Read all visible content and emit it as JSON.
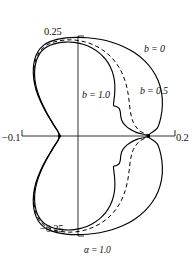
{
  "figure": {
    "title": "",
    "parameter_label": "α = 1.0",
    "axes": {
      "x_left_label": "−0.1",
      "x_right_label": "0.2",
      "y_top_label": "0.25",
      "y_bottom_label": "−0.25"
    },
    "curve_labels": {
      "b0": "b = 0",
      "b05": "b = 0.5",
      "b10": "b = 1.0"
    }
  },
  "chart_data": {
    "type": "line",
    "title": "",
    "subtitle": "",
    "xlabel": "",
    "ylabel": "",
    "xlim": [
      -0.1,
      0.2
    ],
    "ylim": [
      -0.25,
      0.25
    ],
    "grid": false,
    "legend_position": "inline-annotations",
    "xticks": [
      -0.1,
      0.2
    ],
    "xticklabels": [
      "−0.1",
      "0.2"
    ],
    "yticks": [
      -0.25,
      0.25
    ],
    "yticklabels": [
      "−0.25",
      "0.25"
    ],
    "annotations": [
      {
        "text": "b = 0",
        "x": 0.145,
        "y": 0.205
      },
      {
        "text": "b = 0.5",
        "x": 0.135,
        "y": 0.112
      },
      {
        "text": "b = 1.0",
        "x": 0.022,
        "y": 0.105
      },
      {
        "text": "α = 1.0",
        "x": 0.012,
        "y": -0.285
      }
    ],
    "node_points": [
      {
        "x": -0.0265,
        "y": 0.0
      },
      {
        "x": 0.1475,
        "y": 0.0
      }
    ],
    "series": [
      {
        "name": "b = 0",
        "label": "b = 0",
        "style": "solid",
        "color": "#000000",
        "points": [
          [
            -0.0265,
            0.0
          ],
          [
            -0.0391,
            0.0295
          ],
          [
            -0.0531,
            0.0596
          ],
          [
            -0.0645,
            0.0884
          ],
          [
            -0.0726,
            0.1163
          ],
          [
            -0.0771,
            0.1433
          ],
          [
            -0.0778,
            0.1693
          ],
          [
            -0.0748,
            0.1929
          ],
          [
            -0.0683,
            0.2118
          ],
          [
            -0.0586,
            0.2258
          ],
          [
            -0.0462,
            0.2353
          ],
          [
            -0.0314,
            0.2415
          ],
          [
            -0.0139,
            0.2452
          ],
          [
            0.0062,
            0.2466
          ],
          [
            0.0286,
            0.2456
          ],
          [
            0.0523,
            0.2418
          ],
          [
            0.0762,
            0.2345
          ],
          [
            0.0993,
            0.2233
          ],
          [
            0.1209,
            0.2079
          ],
          [
            0.14,
            0.1884
          ],
          [
            0.1556,
            0.1651
          ],
          [
            0.1669,
            0.1386
          ],
          [
            0.1735,
            0.1097
          ],
          [
            0.1753,
            0.079
          ],
          [
            0.1724,
            0.0477
          ],
          [
            0.1649,
            0.019
          ],
          [
            0.1475,
            0.0
          ],
          [
            0.1649,
            -0.019
          ],
          [
            0.1724,
            -0.0477
          ],
          [
            0.1753,
            -0.079
          ],
          [
            0.1735,
            -0.1097
          ],
          [
            0.1669,
            -0.1386
          ],
          [
            0.1556,
            -0.1651
          ],
          [
            0.14,
            -0.1884
          ],
          [
            0.1209,
            -0.2079
          ],
          [
            0.0993,
            -0.2233
          ],
          [
            0.0762,
            -0.2345
          ],
          [
            0.0523,
            -0.2418
          ],
          [
            0.0286,
            -0.2456
          ],
          [
            0.0062,
            -0.2466
          ],
          [
            -0.0139,
            -0.2452
          ],
          [
            -0.0314,
            -0.2415
          ],
          [
            -0.0462,
            -0.2353
          ],
          [
            -0.0586,
            -0.2258
          ],
          [
            -0.0683,
            -0.2118
          ],
          [
            -0.0748,
            -0.1929
          ],
          [
            -0.0778,
            -0.1693
          ],
          [
            -0.0771,
            -0.1433
          ],
          [
            -0.0726,
            -0.1163
          ],
          [
            -0.0645,
            -0.0884
          ],
          [
            -0.0531,
            -0.0596
          ],
          [
            -0.0391,
            -0.0295
          ],
          [
            -0.0265,
            0.0
          ]
        ]
      },
      {
        "name": "b = 0.5",
        "label": "b = 0.5",
        "style": "dashed",
        "color": "#000000",
        "points": [
          [
            -0.0265,
            0.0
          ],
          [
            -0.0385,
            0.029
          ],
          [
            -0.0521,
            0.0586
          ],
          [
            -0.0632,
            0.0869
          ],
          [
            -0.0712,
            0.1143
          ],
          [
            -0.0757,
            0.1409
          ],
          [
            -0.0764,
            0.1664
          ],
          [
            -0.0734,
            0.1896
          ],
          [
            -0.067,
            0.2082
          ],
          [
            -0.0576,
            0.2219
          ],
          [
            -0.0455,
            0.2311
          ],
          [
            -0.0312,
            0.237
          ],
          [
            -0.0148,
            0.24
          ],
          [
            0.0032,
            0.2399
          ],
          [
            0.0219,
            0.2358
          ],
          [
            0.0403,
            0.2277
          ],
          [
            0.0575,
            0.2157
          ],
          [
            0.0726,
            0.2001
          ],
          [
            0.0853,
            0.1812
          ],
          [
            0.0952,
            0.1598
          ],
          [
            0.1024,
            0.1364
          ],
          [
            0.1072,
            0.1116
          ],
          [
            0.1102,
            0.0858
          ],
          [
            0.1127,
            0.0593
          ],
          [
            0.1183,
            0.034
          ],
          [
            0.13,
            0.0135
          ],
          [
            0.1475,
            0.0
          ],
          [
            0.13,
            -0.0135
          ],
          [
            0.1183,
            -0.034
          ],
          [
            0.1127,
            -0.0593
          ],
          [
            0.1102,
            -0.0858
          ],
          [
            0.1072,
            -0.1116
          ],
          [
            0.1024,
            -0.1364
          ],
          [
            0.0952,
            -0.1598
          ],
          [
            0.0853,
            -0.1812
          ],
          [
            0.0726,
            -0.2001
          ],
          [
            0.0575,
            -0.2157
          ],
          [
            0.0403,
            -0.2277
          ],
          [
            0.0219,
            -0.2358
          ],
          [
            0.0032,
            -0.2399
          ],
          [
            -0.0148,
            -0.24
          ],
          [
            -0.0312,
            -0.237
          ],
          [
            -0.0455,
            -0.2311
          ],
          [
            -0.0576,
            -0.2219
          ],
          [
            -0.067,
            -0.2082
          ],
          [
            -0.0734,
            -0.1896
          ],
          [
            -0.0764,
            -0.1664
          ],
          [
            -0.0757,
            -0.1409
          ],
          [
            -0.0712,
            -0.1143
          ],
          [
            -0.0632,
            -0.0869
          ],
          [
            -0.0521,
            -0.0586
          ],
          [
            -0.0385,
            -0.029
          ],
          [
            -0.0265,
            0.0
          ]
        ]
      },
      {
        "name": "b = 1.0",
        "label": "b = 1.0",
        "style": "solid",
        "color": "#000000",
        "points": [
          [
            -0.0265,
            0.0
          ],
          [
            -0.038,
            0.0285
          ],
          [
            -0.0512,
            0.0576
          ],
          [
            -0.0621,
            0.0855
          ],
          [
            -0.07,
            0.1126
          ],
          [
            -0.0745,
            0.1388
          ],
          [
            -0.0752,
            0.1638
          ],
          [
            -0.0722,
            0.1866
          ],
          [
            -0.0659,
            0.2048
          ],
          [
            -0.0567,
            0.2181
          ],
          [
            -0.0448,
            0.2268
          ],
          [
            -0.0309,
            0.2322
          ],
          [
            -0.0151,
            0.2347
          ],
          [
            0.0021,
            0.2341
          ],
          [
            0.0196,
            0.2294
          ],
          [
            0.0363,
            0.2206
          ],
          [
            0.0514,
            0.2078
          ],
          [
            0.064,
            0.1914
          ],
          [
            0.0735,
            0.172
          ],
          [
            0.0795,
            0.1505
          ],
          [
            0.082,
            0.1281
          ],
          [
            0.0817,
            0.1062
          ],
          [
            0.08,
            0.0861
          ],
          [
            0.0797,
            0.076
          ],
          [
            0.0856,
            0.0735
          ],
          [
            0.0905,
            0.069
          ],
          [
            0.0927,
            0.0607
          ],
          [
            0.0936,
            0.05
          ],
          [
            0.0957,
            0.039
          ],
          [
            0.101,
            0.0285
          ],
          [
            0.1105,
            0.018
          ],
          [
            0.125,
            0.0085
          ],
          [
            0.1475,
            0.0
          ],
          [
            0.125,
            -0.0085
          ],
          [
            0.1105,
            -0.018
          ],
          [
            0.101,
            -0.0285
          ],
          [
            0.0957,
            -0.039
          ],
          [
            0.0936,
            -0.05
          ],
          [
            0.0927,
            -0.0607
          ],
          [
            0.0905,
            -0.069
          ],
          [
            0.0856,
            -0.0735
          ],
          [
            0.0797,
            -0.076
          ],
          [
            0.08,
            -0.0861
          ],
          [
            0.0817,
            -0.1062
          ],
          [
            0.082,
            -0.1281
          ],
          [
            0.0795,
            -0.1505
          ],
          [
            0.0735,
            -0.172
          ],
          [
            0.064,
            -0.1914
          ],
          [
            0.0514,
            -0.2078
          ],
          [
            0.0363,
            -0.2206
          ],
          [
            0.0196,
            -0.2294
          ],
          [
            0.0021,
            -0.2341
          ],
          [
            -0.0151,
            -0.2347
          ],
          [
            -0.0309,
            -0.2322
          ],
          [
            -0.0448,
            -0.2268
          ],
          [
            -0.0567,
            -0.2181
          ],
          [
            -0.0659,
            -0.2048
          ],
          [
            -0.0722,
            -0.1866
          ],
          [
            -0.0752,
            -0.1638
          ],
          [
            -0.0745,
            -0.1388
          ],
          [
            -0.07,
            -0.1126
          ],
          [
            -0.0621,
            -0.0855
          ],
          [
            -0.0512,
            -0.0576
          ],
          [
            -0.038,
            -0.0285
          ],
          [
            -0.0265,
            0.0
          ]
        ]
      }
    ]
  }
}
